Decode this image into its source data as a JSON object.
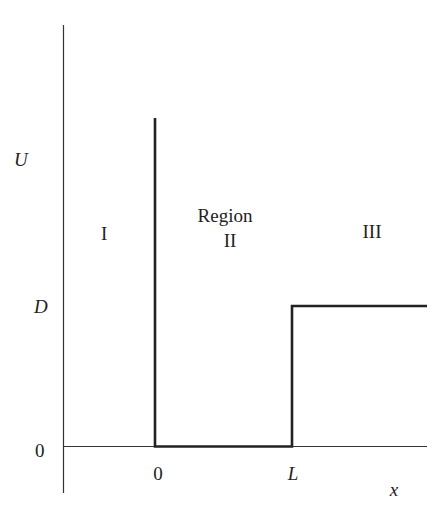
{
  "diagram": {
    "axes": {
      "y_label": "U",
      "x_label": "x",
      "y_ticks": [
        "D",
        "0"
      ],
      "x_ticks": [
        "0",
        "L"
      ]
    },
    "regions": [
      {
        "id": "I",
        "label": "I"
      },
      {
        "id": "II",
        "label_line1": "Region",
        "label_line2": "II"
      },
      {
        "id": "III",
        "label": "III"
      }
    ],
    "potential": {
      "description": "Infinite wall at x=0, zero potential for 0<x<L, step to D for x>L",
      "segments": [
        {
          "from": "x=0 top",
          "to": "x=0, U=0",
          "type": "vertical wall"
        },
        {
          "from": "x=0, U=0",
          "to": "x=L, U=0",
          "type": "flat"
        },
        {
          "from": "x=L, U=0",
          "to": "x=L, U=D",
          "type": "step"
        },
        {
          "from": "x=L, U=D",
          "to": "x=+inf, U=D",
          "type": "flat"
        }
      ]
    },
    "colors": {
      "line": "#222222",
      "background": "#ffffff"
    }
  }
}
